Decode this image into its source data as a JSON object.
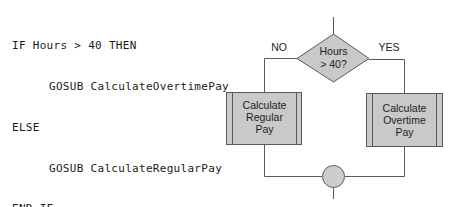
{
  "pseudocode": {
    "lines": [
      {
        "text": "IF Hours > 40 THEN",
        "indent": false
      },
      {
        "text": "GOSUB CalculateOvertimePay",
        "indent": true
      },
      {
        "text": "ELSE",
        "indent": false
      },
      {
        "text": "GOSUB CalculateRegularPay",
        "indent": true
      },
      {
        "text": "END IF",
        "indent": false
      }
    ]
  },
  "flowchart": {
    "decision": {
      "line1": "Hours",
      "line2": "> 40?"
    },
    "branch_no_label": "NO",
    "branch_yes_label": "YES",
    "regular_pay_box": {
      "line1": "Calculate",
      "line2": "Regular",
      "line3": "Pay"
    },
    "overtime_pay_box": {
      "line1": "Calculate",
      "line2": "Overtime",
      "line3": "Pay"
    },
    "colors": {
      "shape_fill": "#c9c9c9",
      "connector_fill": "#cdcdcd",
      "line": "#5a5a5a"
    }
  }
}
